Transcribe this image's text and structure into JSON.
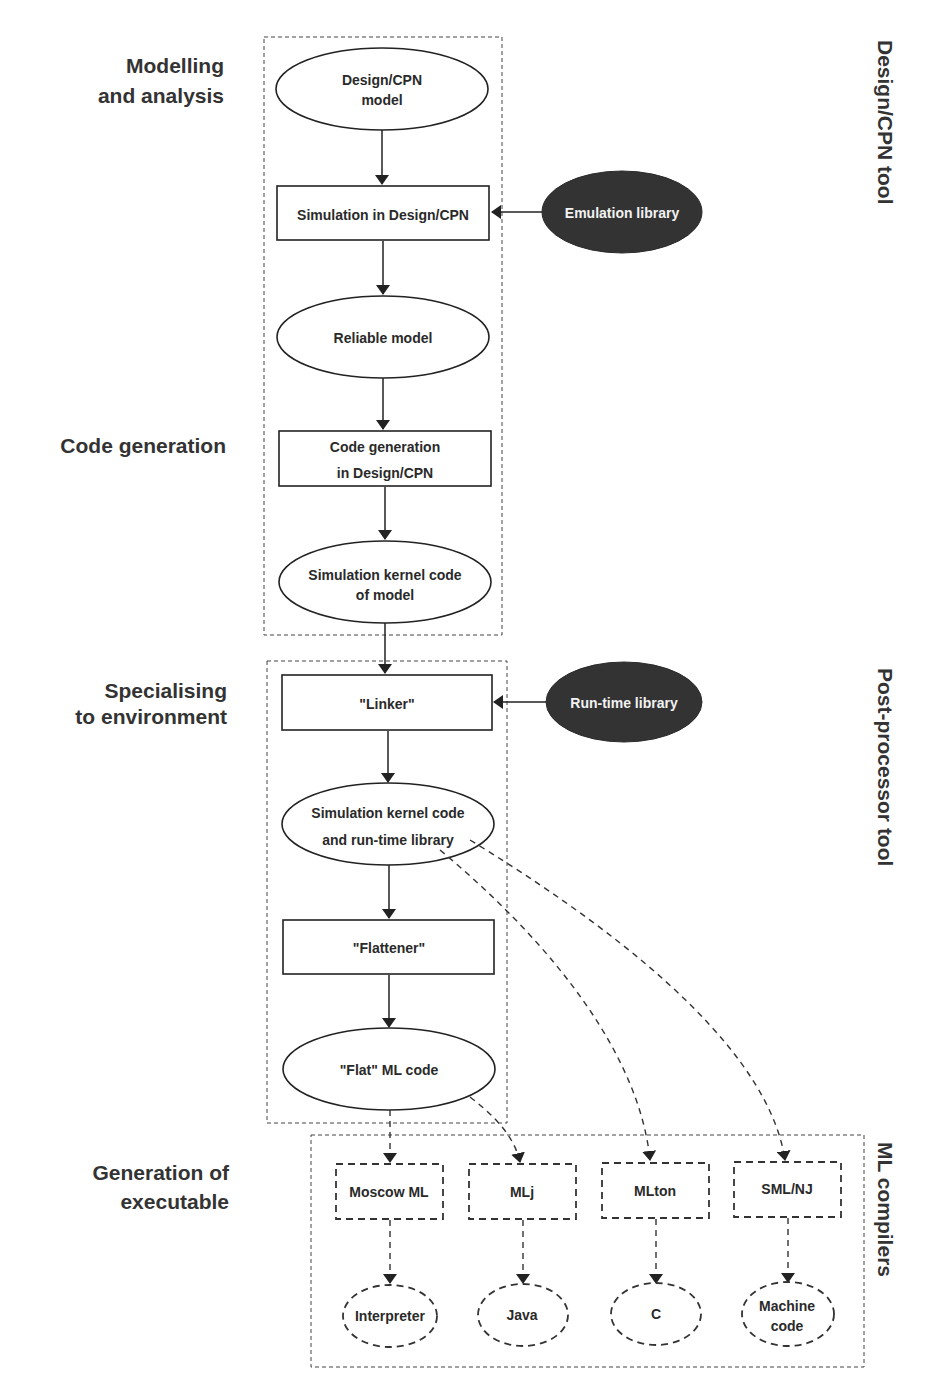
{
  "stages": {
    "modelling_1": "Modelling",
    "modelling_2": "and analysis",
    "code_generation": "Code generation",
    "specialising_1": "Specialising",
    "specialising_2": "to environment",
    "generation_1": "Generation of",
    "generation_2": "executable"
  },
  "tools": {
    "design_cpn": "Design/CPN tool",
    "post_processor": "Post-processor tool",
    "ml_compilers": "ML compilers"
  },
  "nodes": {
    "design_cpn_model_1": "Design/CPN",
    "design_cpn_model_2": "model",
    "simulation": "Simulation in Design/CPN",
    "emulation_library": "Emulation library",
    "reliable_model": "Reliable model",
    "code_gen_1": "Code generation",
    "code_gen_2": "in Design/CPN",
    "kernel_code_1": "Simulation kernel code",
    "kernel_code_2": "of model",
    "linker": "\"Linker\"",
    "runtime_library": "Run-time library",
    "kernel_runtime_1": "Simulation kernel code",
    "kernel_runtime_2": "and run-time library",
    "flattener": "\"Flattener\"",
    "flat_ml": "\"Flat\" ML code"
  },
  "compilers": [
    {
      "name": "Moscow ML",
      "output": "Interpreter"
    },
    {
      "name": "MLj",
      "output": "Java"
    },
    {
      "name": "MLton",
      "output": "C"
    },
    {
      "name": "SML/NJ",
      "output_1": "Machine",
      "output_2": "code"
    }
  ],
  "colors": {
    "text": "#333333",
    "dark_node": "#333333",
    "dark_node_text": "#f2f2f2"
  }
}
